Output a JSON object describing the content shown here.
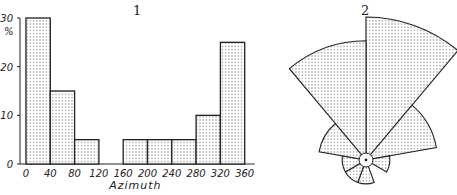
{
  "figure": {
    "panel_labels": [
      "1",
      "2"
    ]
  },
  "chart_data": [
    {
      "type": "bar",
      "title": "1",
      "xlabel": "Azimuth",
      "ylabel": "%",
      "categories": [
        "0-40",
        "40-80",
        "80-120",
        "120-160",
        "160-200",
        "200-240",
        "240-280",
        "280-320",
        "320-360"
      ],
      "values": [
        30,
        15,
        5,
        0,
        5,
        5,
        5,
        10,
        25
      ],
      "x_ticks": [
        "0",
        "40",
        "80",
        "120",
        "160",
        "200",
        "240",
        "280",
        "320",
        "360"
      ],
      "y_ticks": [
        "0",
        "10",
        "20",
        "30"
      ],
      "ylim": [
        0,
        30
      ],
      "grid": false,
      "fill": "dot stipple"
    },
    {
      "type": "rose",
      "title": "2",
      "sectors_deg": [
        [
          0,
          40
        ],
        [
          40,
          80
        ],
        [
          80,
          120
        ],
        [
          120,
          160
        ],
        [
          160,
          200
        ],
        [
          200,
          240
        ],
        [
          240,
          280
        ],
        [
          280,
          320
        ],
        [
          320,
          360
        ]
      ],
      "values": [
        30,
        15,
        5,
        0,
        5,
        5,
        5,
        10,
        25
      ],
      "fill": "dot stipple"
    }
  ]
}
